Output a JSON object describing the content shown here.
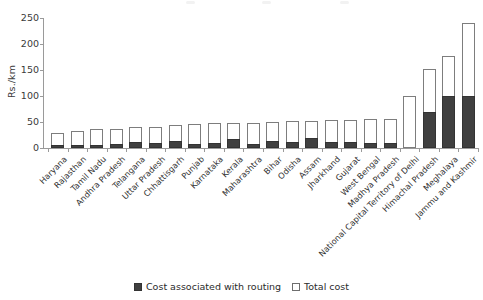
{
  "chart_data": {
    "type": "bar",
    "title": "",
    "subtitle": "",
    "xlabel": "",
    "ylabel": "Rs./km",
    "ylim": [
      0,
      250
    ],
    "yticks": [
      0,
      50,
      100,
      150,
      200,
      250
    ],
    "grid": false,
    "stacked_overlay": true,
    "legend_position": "bottom-center",
    "categories": [
      "Haryana",
      "Rajasthan",
      "Tamil Nadu",
      "Andhra Pradesh",
      "Telangana",
      "Uttar Pradesh",
      "Chhattisgarh",
      "Punjab",
      "Karnataka",
      "Kerala",
      "Maharashtra",
      "Bihar",
      "Odisha",
      "Assam",
      "Jharkhand",
      "Gujarat",
      "West Bengal",
      "Madhya Pradesh",
      "National Capital Territory of Delhi",
      "Himachal Pradesh",
      "Meghalaya",
      "Jammu and Kashmir"
    ],
    "series": [
      {
        "name": "Cost associated with routing",
        "color": "#404040",
        "values": [
          5,
          6,
          6,
          8,
          11,
          9,
          14,
          7,
          10,
          18,
          8,
          14,
          11,
          19,
          11,
          12,
          9,
          10,
          0,
          70,
          100,
          100
        ]
      },
      {
        "name": "Total cost",
        "color": "#ffffff",
        "values": [
          28,
          33,
          36,
          37,
          40,
          41,
          45,
          47,
          48,
          48,
          49,
          50,
          51,
          52,
          53,
          53,
          55,
          56,
          100,
          152,
          176,
          240
        ]
      }
    ]
  },
  "legend": {
    "entries": [
      {
        "label": "Cost associated with routing",
        "style": "filled"
      },
      {
        "label": "Total cost",
        "style": "open"
      }
    ]
  },
  "axes": {
    "y_title": "Rs./km",
    "y_tick_labels": [
      "0",
      "50",
      "100",
      "150",
      "200",
      "250"
    ]
  }
}
